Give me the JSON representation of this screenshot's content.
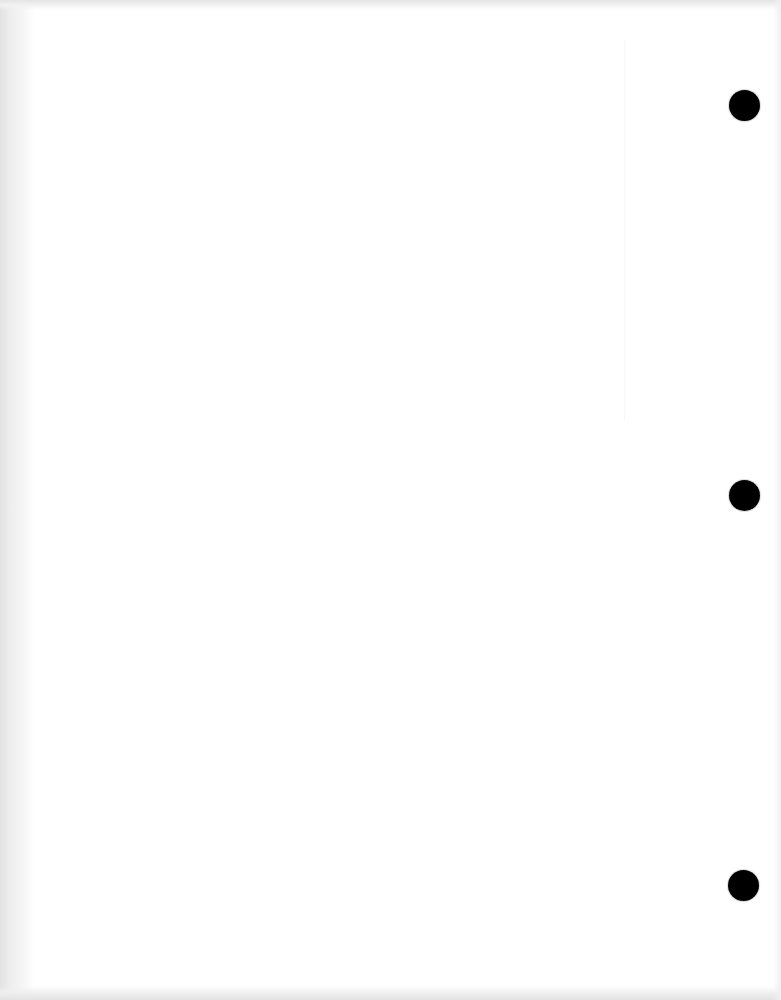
{
  "page": {
    "background_color": "#ffffff",
    "edge_shading_color": "#e2e2e2",
    "text_content": ""
  },
  "punch_holes": [
    {
      "cx": 744,
      "cy": 105,
      "r": 15,
      "color": "#000000"
    },
    {
      "cx": 744,
      "cy": 495,
      "r": 15,
      "color": "#000000"
    },
    {
      "cx": 743,
      "cy": 885,
      "r": 15,
      "color": "#000000"
    }
  ]
}
